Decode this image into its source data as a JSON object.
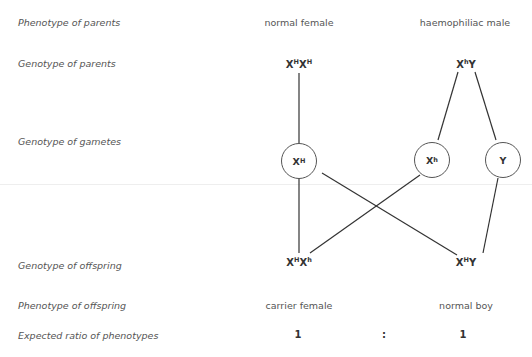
{
  "row_labels": {
    "phenotype_parents": "Phenotype of parents",
    "genotype_parents": "Genotype of parents",
    "genotype_gametes": "Genotype of gametes",
    "genotype_offspring": "Genotype of offspring",
    "phenotype_offspring": "Phenotype of offspring",
    "expected_ratio": "Expected ratio of phenotypes"
  },
  "parents": {
    "mother": {
      "phenotype": "normal female",
      "genotype": {
        "a": "X",
        "a_sup": "H",
        "b": "X",
        "b_sup": "H"
      }
    },
    "father": {
      "phenotype": "haemophiliac male",
      "genotype": {
        "a": "X",
        "a_sup": "h",
        "b": "Y",
        "b_sup": ""
      }
    }
  },
  "gametes": [
    {
      "base": "X",
      "sup": "H"
    },
    {
      "base": "X",
      "sup": "h"
    },
    {
      "base": "Y",
      "sup": ""
    }
  ],
  "offspring": [
    {
      "genotype": {
        "a": "X",
        "a_sup": "H",
        "b": "X",
        "b_sup": "h"
      },
      "phenotype": "carrier female",
      "ratio": "1"
    },
    {
      "genotype": {
        "a": "X",
        "a_sup": "H",
        "b": "Y",
        "b_sup": ""
      },
      "phenotype": "normal boy",
      "ratio": "1"
    }
  ],
  "ratio_separator": ":"
}
